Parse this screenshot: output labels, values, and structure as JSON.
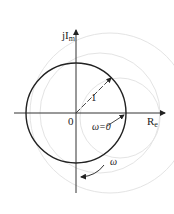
{
  "diagram": {
    "type": "polar-plot",
    "axes": {
      "imag_label": "jI",
      "imag_label_sub": "m",
      "real_label": "R",
      "real_label_sub": "e",
      "origin_label": "0"
    },
    "circle": {
      "radius_label": "1"
    },
    "annotations": {
      "omega_zero": "ω=0",
      "omega_dir": "ω"
    },
    "colors": {
      "stroke": "#222222",
      "faint": "#dcdcdc"
    }
  }
}
